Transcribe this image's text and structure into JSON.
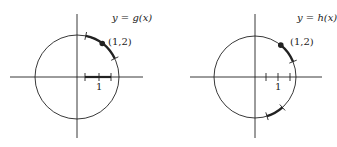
{
  "figures": [
    {
      "id": "left",
      "function_label": "y = g(x)",
      "function_label_parts": {
        "pre": "y",
        "eq": "=",
        "fn": "g",
        "arg": "(x)"
      },
      "point_label": "(1,2)",
      "axis_tick_label": "1",
      "center": [
        77,
        77
      ],
      "radius": 42,
      "point_angle_deg": 53,
      "thick_arcs": [
        [
          26,
          78
        ]
      ],
      "arc_ticks_deg": [
        78,
        26
      ],
      "x_ticks": [
        85,
        99,
        111
      ],
      "thick_x_segment": [
        85,
        111
      ],
      "x_axis": [
        10,
        143
      ],
      "y_axis": [
        14,
        138
      ]
    },
    {
      "id": "right",
      "function_label": "y = h(x)",
      "function_label_parts": {
        "pre": "y",
        "eq": "=",
        "fn": "h",
        "arg": "(x)"
      },
      "point_label": "(1,2)",
      "axis_tick_label": "1",
      "center": [
        255,
        77
      ],
      "radius": 41,
      "point_angle_deg": 51,
      "thick_arcs": [
        [
          22,
          51
        ],
        [
          -73,
          -48
        ]
      ],
      "arc_ticks_deg": [
        22,
        -73,
        -48
      ],
      "x_ticks": [
        266,
        278,
        290
      ],
      "thick_x_segment": null,
      "x_axis": [
        190,
        322
      ],
      "y_axis": [
        14,
        138
      ]
    }
  ],
  "colors": {
    "stroke": "#222222",
    "background": "#ffffff"
  }
}
